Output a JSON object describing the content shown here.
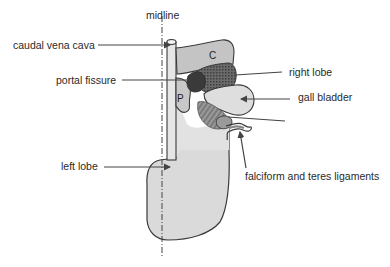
{
  "figure": {
    "type": "anatomical-diagram",
    "labels": {
      "midline": "midline",
      "caudal_vena_cava": "caudal vena cava",
      "portal_fissure": "portal fissure",
      "right_lobe": "right lobe",
      "gall_bladder": "gall bladder",
      "left_lobe": "left lobe",
      "falciform_teres": "falciform and teres ligaments"
    },
    "region_letters": {
      "caudate": "C",
      "papillary": "P"
    }
  },
  "colors": {
    "lobe_fill": "#d9d9d9",
    "caudate_fill": "#c2c2c2",
    "right_lobe_fill": "#5a5a5a",
    "portal_fill": "#3a3a3a",
    "outline": "#3a3a3a",
    "gall_fill": "#dcdcdc",
    "stripe_fill": "#8a8a8a",
    "leader": "#444444"
  }
}
